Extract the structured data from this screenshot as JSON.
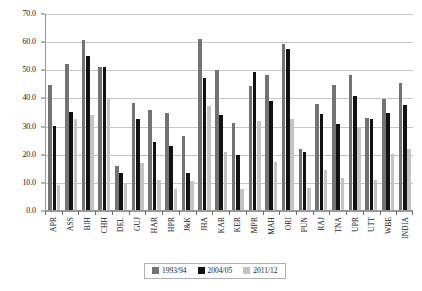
{
  "chart_data": {
    "type": "bar",
    "title": "",
    "subtitle": "",
    "xlabel": "",
    "ylabel": "",
    "ylim": [
      0.0,
      70.0
    ],
    "ytick_step": 10.0,
    "ytick_labels": [
      "0.0",
      "10.0",
      "20.0",
      "30.0",
      "40.0",
      "50.0",
      "60.0",
      "70.0"
    ],
    "ytick_values": [
      0.0,
      10.0,
      20.0,
      30.0,
      40.0,
      50.0,
      60.0,
      70.0
    ],
    "grid": true,
    "grid_axis": "y",
    "legend_position": "bottom",
    "categories": [
      "APR",
      "ASS",
      "BIH",
      "CHH",
      "DEL",
      "GUJ",
      "HAR",
      "HPR",
      "J&K",
      "JHA",
      "KAR",
      "KER",
      "MPR",
      "MAH",
      "ORI",
      "PUN",
      "RAJ",
      "TNA",
      "UPR",
      "UTT",
      "WBE",
      "INDIA"
    ],
    "series": [
      {
        "name": "1993/94",
        "color": "#737373",
        "values": [
          44.5,
          52.0,
          60.4,
          50.9,
          15.6,
          38.0,
          35.5,
          34.5,
          26.4,
          60.7,
          49.8,
          31.0,
          44.0,
          48.1,
          59.0,
          21.7,
          37.5,
          44.4,
          48.0,
          32.6,
          39.5,
          45.1
        ]
      },
      {
        "name": "2004/05",
        "color": "#121212",
        "values": [
          29.7,
          34.7,
          54.6,
          50.8,
          13.0,
          32.3,
          24.0,
          22.9,
          13.1,
          47.0,
          33.6,
          19.6,
          49.0,
          38.7,
          57.2,
          20.6,
          34.0,
          30.4,
          40.6,
          32.4,
          34.4,
          37.3
        ]
      },
      {
        "name": "2011/12",
        "color": "#c4c4c4",
        "values": [
          8.8,
          32.3,
          33.8,
          39.9,
          9.6,
          16.7,
          10.7,
          7.6,
          10.3,
          37.0,
          20.7,
          7.6,
          31.5,
          17.0,
          32.4,
          7.7,
          14.3,
          11.2,
          29.2,
          10.8,
          20.0,
          21.6
        ]
      }
    ]
  }
}
